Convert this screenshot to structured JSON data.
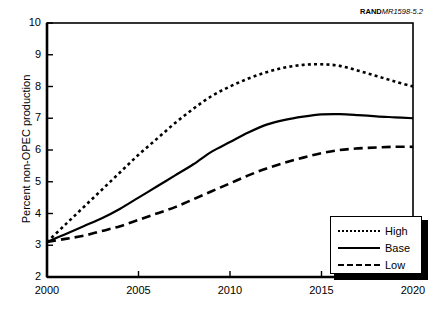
{
  "source_label": {
    "bold": "RAND",
    "italic": "MR1598-5.2"
  },
  "chart_data": {
    "type": "line",
    "title": "",
    "xlabel": "",
    "ylabel": "Percent non-OPEC production",
    "xlim": [
      2000,
      2020
    ],
    "ylim": [
      2,
      10
    ],
    "xticks": [
      "2000",
      "2005",
      "2010",
      "2015",
      "2020"
    ],
    "xtick_values": [
      2000,
      2005,
      2010,
      2015,
      2020
    ],
    "yticks": [
      "2",
      "3",
      "4",
      "5",
      "6",
      "7",
      "8",
      "9",
      "10"
    ],
    "ytick_values": [
      2,
      3,
      4,
      5,
      6,
      7,
      8,
      9,
      10
    ],
    "grid": false,
    "legend_position": "lower right",
    "x": [
      2000,
      2001,
      2002,
      2003,
      2004,
      2005,
      2006,
      2007,
      2008,
      2009,
      2010,
      2011,
      2012,
      2013,
      2014,
      2015,
      2016,
      2017,
      2018,
      2019,
      2020
    ],
    "series": [
      {
        "name": "High",
        "style": "dotted",
        "values": [
          3.1,
          3.65,
          4.2,
          4.75,
          5.3,
          5.85,
          6.35,
          6.85,
          7.3,
          7.7,
          8.0,
          8.25,
          8.45,
          8.6,
          8.68,
          8.7,
          8.65,
          8.5,
          8.33,
          8.16,
          8.0
        ]
      },
      {
        "name": "Base",
        "style": "solid",
        "values": [
          3.1,
          3.35,
          3.6,
          3.85,
          4.15,
          4.5,
          4.85,
          5.2,
          5.55,
          5.95,
          6.25,
          6.55,
          6.8,
          6.95,
          7.05,
          7.12,
          7.13,
          7.1,
          7.06,
          7.03,
          7.0
        ]
      },
      {
        "name": "Low",
        "style": "dashed",
        "values": [
          3.1,
          3.2,
          3.3,
          3.45,
          3.6,
          3.8,
          4.0,
          4.2,
          4.45,
          4.7,
          4.95,
          5.2,
          5.42,
          5.6,
          5.76,
          5.9,
          6.0,
          6.05,
          6.08,
          6.1,
          6.1
        ]
      }
    ]
  },
  "legend": {
    "items": [
      {
        "label": "High",
        "style": "dotted"
      },
      {
        "label": "Base",
        "style": "solid"
      },
      {
        "label": "Low",
        "style": "dashed"
      }
    ]
  }
}
